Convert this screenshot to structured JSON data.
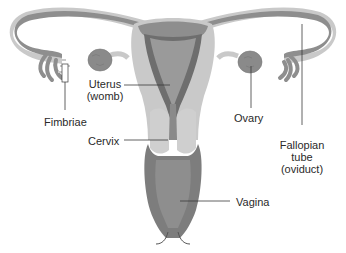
{
  "diagram": {
    "colors": {
      "background": "#ffffff",
      "outer_wall": "#c9c9c9",
      "tube_fill": "#8e8e8e",
      "muscle_dark": "#6e6e6e",
      "cavity": "#9a9a9a",
      "cervix_light": "#cfcfcf",
      "vagina": "#7d7d7d",
      "ovary": "#8a8a8a",
      "leader_line": "#3a3a3a",
      "text": "#2a2a2a"
    },
    "labels": {
      "uterus_line1": "Uterus",
      "uterus_line2": "(womb)",
      "fimbriae": "Fimbriae",
      "cervix": "Cervix",
      "ovary": "Ovary",
      "fallopian_line1": "Fallopian",
      "fallopian_line2": "tube",
      "fallopian_line3": "(oviduct)",
      "vagina": "Vagina"
    }
  }
}
